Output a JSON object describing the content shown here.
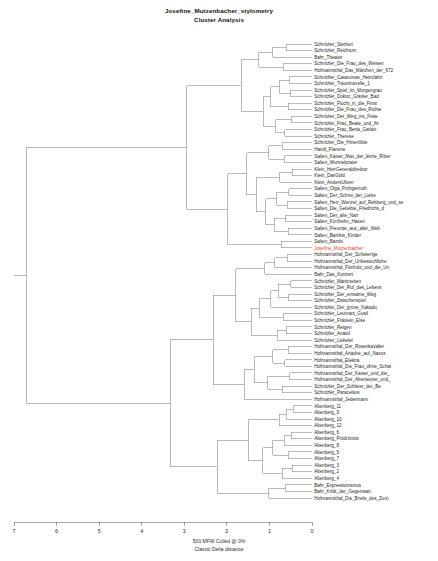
{
  "title": {
    "line1": "Josefine_Mutzenbacher_stylometry",
    "line2": "Cluster Analysis"
  },
  "caption": {
    "line1": "500 MFW  Culled @ 0%",
    "line2": "Classic Delta distance"
  },
  "axis": {
    "label": "",
    "ticks": [
      "7",
      "6",
      "5",
      "4",
      "3",
      "2",
      "1",
      "0"
    ],
    "min": 0,
    "max": 7,
    "reversed": true
  },
  "colors": {
    "branch": "#8d8d8d",
    "text": "#1f1f1f",
    "highlight": "#e8441f",
    "background": "#ffffff"
  },
  "highlight_leaf": "Josefine_Mutzenbacher",
  "chart_data": {
    "type": "dendrogram",
    "title": "Josefine_Mutzenbacher_stylometry Cluster Analysis",
    "xlabel": "Classic Delta distance",
    "ylabel": "",
    "xlim": [
      7,
      0
    ],
    "grid": false,
    "legend": "none",
    "orientation": "horizontal-right-leaves",
    "distance_metric": "Classic Delta distance",
    "features": "500 MFW Culled @ 0%",
    "leaves": [
      "Schnitzler_Sterben",
      "Schnitzler_Reichtum",
      "Bahr_Theater",
      "Schnitzler_Die_Frau_des_Weisen",
      "Hofmannsthal_Das_Märchen_der_672",
      "Schnitzler_Casanovas_Heimfahrt",
      "Schnitzler_Traumnovelle_1",
      "Schnitzler_Spiel_im_Morgengrau",
      "Schnitzler_Doktor_Gräsler_Bad",
      "Schnitzler_Flucht_in_die_Finst",
      "Schnitzler_Die_Frau_des_Richte",
      "Schnitzler_Der_Weg_ins_Freie",
      "Schnitzler_Frau_Beate_und_ihr",
      "Schnitzler_Frau_Berta_Garlan",
      "Schnitzler_Therese",
      "Schnitzler_Die_Hirtenflöte",
      "Handl_Flamme",
      "Salten_Kaiser_Max_der_letzte_Ritter",
      "Salten_Wurstelprater",
      "Klein_HerrGeneraldirektor",
      "Klein_DasGold",
      "Klein_AndersUltem",
      "Salten_Olga_Frohgemuth",
      "Salten_Der_Schrei_der_Liebe",
      "Salten_Herr_Wenzel_auf_Rehberg_und_se",
      "Salten_Die_Geliebte_Friedrichs_d",
      "Salten_Der_alte_Narr",
      "Salten_Fünfzehn_Hasen",
      "Salten_Freunde_aus_aller_Welt",
      "Salten_Bambis_Kinder",
      "Salten_Bambi",
      "Josefine_Mutzenbacher",
      "Hofmannsthal_Der_Schwierige",
      "Hofmannsthal_Der_Unbestechliche",
      "Hofmannsthal_Florindo_und_die_Un",
      "Bahr_Das_Konzert",
      "Schnitzler_Marionetten",
      "Schnitzler_Der_Ruf_des_Lebens",
      "Schnitzler_Der_einsame_Weg",
      "Schnitzler_Zwischenspiel",
      "Schnitzler_Der_grüne_Kakadu",
      "Schnitzler_Leutnant_Gustl",
      "Schnitzler_Fräulein_Else",
      "Schnitzler_Reigen",
      "Schnitzler_Anatol",
      "Schnitzler_Liebelei",
      "Hofmannsthal_Der_Rosenkavalier",
      "Hofmannsthal_Ariadne_auf_Naxos",
      "Hofmannsthal_Elektra",
      "Hofmannsthal_Die_Frau_ohne_Schat",
      "Hofmannsthal_Der_Kaiser_und_die_",
      "Hofmannsthal_Der_Abenteurer_und_",
      "Schnitzler_Der_Schleier_der_Be",
      "Schnitzler_Paracelsus",
      "Hofmannsthal_Jedermann",
      "Altenberg_11",
      "Altenberg_9",
      "Altenberg_10",
      "Altenberg_12",
      "Altenberg_6",
      "Altenberg_Pródrömös",
      "Altenberg_8",
      "Altenberg_5",
      "Altenberg_7",
      "Altenberg_3",
      "Altenberg_2",
      "Altenberg_4",
      "Bahr_Expressionismus",
      "Bahr_Kritik_der_Gegenwart",
      "Hofmannsthal_Die_Briefe_des_Zurü"
    ],
    "merges": [
      {
        "a": 0,
        "b": 1,
        "height": 0.62
      },
      {
        "a": 70,
        "b": 2,
        "height": 0.95
      },
      {
        "a": 3,
        "b": 4,
        "height": 0.7
      },
      {
        "a": 71,
        "b": 72,
        "height": 1.3
      },
      {
        "a": 5,
        "b": 6,
        "height": 0.55
      },
      {
        "a": 7,
        "b": 8,
        "height": 0.52
      },
      {
        "a": 74,
        "b": 75,
        "height": 0.8
      },
      {
        "a": 9,
        "b": 10,
        "height": 0.58
      },
      {
        "a": 76,
        "b": 77,
        "height": 1.0
      },
      {
        "a": 11,
        "b": 12,
        "height": 0.5
      },
      {
        "a": 13,
        "b": 14,
        "height": 0.66
      },
      {
        "a": 79,
        "b": 80,
        "height": 0.88
      },
      {
        "a": 78,
        "b": 81,
        "height": 1.18
      },
      {
        "a": 73,
        "b": 82,
        "height": 1.72
      },
      {
        "a": 15,
        "b": 16,
        "height": 0.72
      },
      {
        "a": 17,
        "b": 18,
        "height": 0.68
      },
      {
        "a": 84,
        "b": 85,
        "height": 1.05
      },
      {
        "a": 19,
        "b": 20,
        "height": 0.48
      },
      {
        "a": 87,
        "b": 21,
        "height": 0.78
      },
      {
        "a": 22,
        "b": 23,
        "height": 0.56
      },
      {
        "a": 24,
        "b": 25,
        "height": 0.6
      },
      {
        "a": 89,
        "b": 90,
        "height": 0.86
      },
      {
        "a": 26,
        "b": 27,
        "height": 0.64
      },
      {
        "a": 28,
        "b": 29,
        "height": 0.58
      },
      {
        "a": 92,
        "b": 93,
        "height": 0.92
      },
      {
        "a": 91,
        "b": 94,
        "height": 1.12
      },
      {
        "a": 88,
        "b": 95,
        "height": 1.35
      },
      {
        "a": 86,
        "b": 96,
        "height": 1.58
      },
      {
        "a": 30,
        "b": 31,
        "height": 0.75
      },
      {
        "a": 97,
        "b": 98,
        "height": 2.05
      },
      {
        "a": 83,
        "b": 99,
        "height": 3.05
      },
      {
        "a": 32,
        "b": 33,
        "height": 0.6
      },
      {
        "a": 101,
        "b": 34,
        "height": 0.9
      },
      {
        "a": 102,
        "b": 35,
        "height": 1.15
      },
      {
        "a": 36,
        "b": 37,
        "height": 0.52
      },
      {
        "a": 38,
        "b": 39,
        "height": 0.56
      },
      {
        "a": 104,
        "b": 105,
        "height": 0.82
      },
      {
        "a": 106,
        "b": 40,
        "height": 1.0
      },
      {
        "a": 41,
        "b": 42,
        "height": 0.7
      },
      {
        "a": 107,
        "b": 108,
        "height": 1.28
      },
      {
        "a": 43,
        "b": 44,
        "height": 0.62
      },
      {
        "a": 110,
        "b": 45,
        "height": 0.85
      },
      {
        "a": 109,
        "b": 111,
        "height": 1.48
      },
      {
        "a": 103,
        "b": 112,
        "height": 1.85
      },
      {
        "a": 46,
        "b": 47,
        "height": 0.58
      },
      {
        "a": 48,
        "b": 49,
        "height": 0.66
      },
      {
        "a": 114,
        "b": 115,
        "height": 0.95
      },
      {
        "a": 50,
        "b": 51,
        "height": 0.54
      },
      {
        "a": 52,
        "b": 53,
        "height": 0.72
      },
      {
        "a": 117,
        "b": 118,
        "height": 1.08
      },
      {
        "a": 116,
        "b": 119,
        "height": 1.4
      },
      {
        "a": 120,
        "b": 54,
        "height": 1.65
      },
      {
        "a": 113,
        "b": 121,
        "height": 2.4
      },
      {
        "a": 55,
        "b": 56,
        "height": 0.45
      },
      {
        "a": 123,
        "b": 57,
        "height": 0.62
      },
      {
        "a": 124,
        "b": 58,
        "height": 0.8
      },
      {
        "a": 59,
        "b": 60,
        "height": 0.5
      },
      {
        "a": 126,
        "b": 61,
        "height": 0.68
      },
      {
        "a": 62,
        "b": 63,
        "height": 0.58
      },
      {
        "a": 127,
        "b": 128,
        "height": 0.95
      },
      {
        "a": 64,
        "b": 65,
        "height": 0.48
      },
      {
        "a": 130,
        "b": 66,
        "height": 0.72
      },
      {
        "a": 129,
        "b": 131,
        "height": 1.2
      },
      {
        "a": 125,
        "b": 132,
        "height": 1.55
      },
      {
        "a": 67,
        "b": 68,
        "height": 0.65
      },
      {
        "a": 134,
        "b": 69,
        "height": 1.05
      },
      {
        "a": 133,
        "b": 135,
        "height": 2.3
      },
      {
        "a": 122,
        "b": 136,
        "height": 3.45
      },
      {
        "a": 100,
        "b": 137,
        "height": 6.95
      }
    ]
  }
}
